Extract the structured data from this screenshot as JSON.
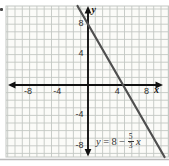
{
  "figure": {
    "cropped_left_edge_mark": "."
  },
  "chart_data": {
    "type": "line",
    "title": "",
    "xlabel": "x",
    "ylabel": "y",
    "axis_labels": {
      "x": "x",
      "y": "y"
    },
    "equation_text": "y = 8 - (5/3)x",
    "equation": {
      "lhs": "y",
      "equals": "=",
      "constant": "8",
      "minus": "−",
      "fraction": {
        "numerator": "5",
        "denominator": "3"
      },
      "variable": "x"
    },
    "line": {
      "slope": -1.6666667,
      "slope_fraction": "-5/3",
      "y_intercept": 8,
      "x_intercept": 4.8
    },
    "sample_points": [
      {
        "x": 0,
        "y": 8
      },
      {
        "x": 4.8,
        "y": 0
      }
    ],
    "x_ticks": [
      {
        "value": -8,
        "label": "-8"
      },
      {
        "value": -4,
        "label": "-4"
      },
      {
        "value": 4,
        "label": "4"
      },
      {
        "value": 8,
        "label": "8"
      }
    ],
    "y_ticks": [
      {
        "value": 8,
        "label": "8"
      },
      {
        "value": 4,
        "label": "4"
      },
      {
        "value": -4,
        "label": "-4"
      },
      {
        "value": -8,
        "label": "-8"
      }
    ],
    "xlim": [
      -11,
      11
    ],
    "ylim": [
      -9.5,
      10.5
    ],
    "grid": true,
    "grid_step": 1,
    "colors": {
      "line": "#4f4f4f",
      "axis": "#111111",
      "grid": "#c3c7c3",
      "grid_bg": "#fbfbf8",
      "text": "#2e2e2e",
      "shadow": "#a3a3a3"
    }
  }
}
